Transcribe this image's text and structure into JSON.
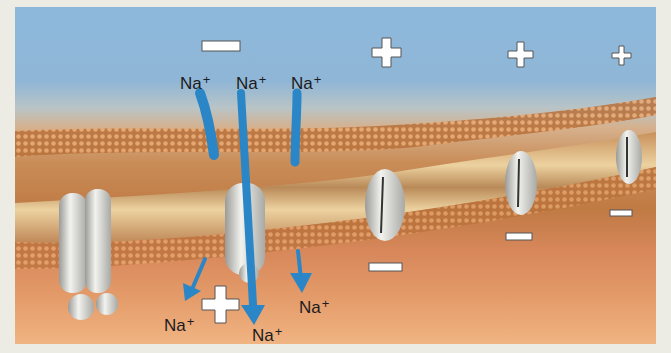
{
  "figure": {
    "ion_labels": {
      "outside_1": "Na",
      "outside_2": "Na",
      "outside_3": "Na",
      "inside_1": "Na",
      "inside_2": "Na",
      "inside_3": "Na",
      "charge": "+"
    },
    "outside_charges": [
      "minus",
      "plus",
      "plus",
      "plus"
    ],
    "inside_charges": [
      "plus",
      "minus",
      "minus",
      "minus"
    ],
    "colors": {
      "extracellular": "#8db8dc",
      "cytoplasm": "#d7875a",
      "membrane_tails": "#e8c890",
      "channel_protein": "#dcdcd8",
      "ion_arrow": "#2a86c6",
      "sign_fill": "#ffffff",
      "sign_outline": "#5a5a5a"
    }
  }
}
